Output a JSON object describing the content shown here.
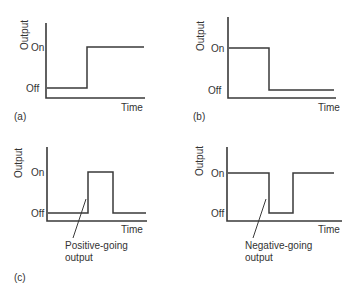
{
  "panels": {
    "a": {
      "caption": "(a)",
      "ylabel": "Output",
      "xlabel": "Time",
      "levels": {
        "on": "On",
        "off": "Off"
      },
      "description": "Step from Off to On"
    },
    "b": {
      "caption": "(b)",
      "ylabel": "Output",
      "xlabel": "Time",
      "levels": {
        "on": "On",
        "off": "Off"
      },
      "description": "Step from On to Off"
    },
    "c": {
      "ylabel": "Output",
      "xlabel": "Time",
      "levels": {
        "on": "On",
        "off": "Off"
      },
      "annotation_line1": "Positive-going",
      "annotation_line2": "output",
      "description": "Positive pulse"
    },
    "d": {
      "ylabel": "Output",
      "xlabel": "Time",
      "levels": {
        "on": "On",
        "off": "Off"
      },
      "annotation_line1": "Negative-going",
      "annotation_line2": "output",
      "description": "Negative pulse"
    },
    "bottom_caption": "(c)"
  },
  "colors": {
    "line": "#3a3a3a",
    "text": "#333333",
    "background": "#ffffff"
  }
}
